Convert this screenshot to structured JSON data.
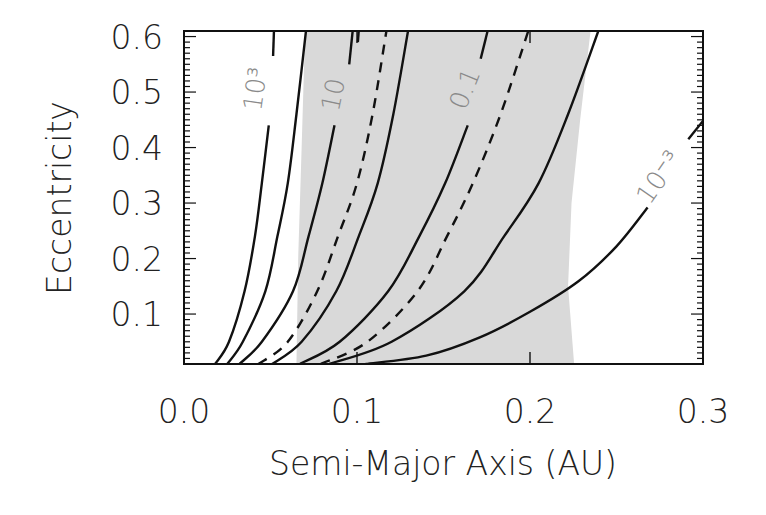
{
  "chart_data": {
    "type": "line",
    "title": "",
    "xlabel": "Semi-Major Axis (AU)",
    "ylabel": "Eccentricity",
    "xlim": [
      0.0,
      0.3
    ],
    "ylim": [
      0.01,
      0.61
    ],
    "grid": false,
    "legend": null,
    "x_ticks": [
      {
        "value": 0.0,
        "label": "0.0"
      },
      {
        "value": 0.1,
        "label": "0.1"
      },
      {
        "value": 0.2,
        "label": "0.2"
      },
      {
        "value": 0.3,
        "label": "0.3"
      }
    ],
    "y_ticks": [
      {
        "value": 0.1,
        "label": "0.1"
      },
      {
        "value": 0.2,
        "label": "0.2"
      },
      {
        "value": 0.3,
        "label": "0.3"
      },
      {
        "value": 0.4,
        "label": "0.4"
      },
      {
        "value": 0.5,
        "label": "0.5"
      },
      {
        "value": 0.6,
        "label": "0.6"
      }
    ],
    "shaded_region": {
      "color": "#d9d9d9",
      "left_edge": [
        [
          0.065,
          0.01
        ],
        [
          0.066,
          0.2
        ],
        [
          0.068,
          0.4
        ],
        [
          0.07,
          0.61
        ]
      ],
      "right_edge": [
        [
          0.235,
          0.61
        ],
        [
          0.229,
          0.45
        ],
        [
          0.224,
          0.3
        ],
        [
          0.222,
          0.15
        ],
        [
          0.2255,
          0.01
        ]
      ]
    },
    "series": [
      {
        "name": "10^3",
        "label": "10³",
        "style": "solid",
        "segments": [
          [
            [
              0.018,
              0.01
            ],
            [
              0.026,
              0.05
            ],
            [
              0.035,
              0.141
            ],
            [
              0.041,
              0.24
            ],
            [
              0.045,
              0.336
            ],
            [
              0.049,
              0.44
            ]
          ],
          [
            [
              0.0515,
              0.565
            ],
            [
              0.052,
              0.61
            ]
          ]
        ]
      },
      {
        "name": "c2",
        "label": "",
        "style": "solid",
        "segments": [
          [
            [
              0.025,
              0.01
            ],
            [
              0.034,
              0.05
            ],
            [
              0.047,
              0.141
            ],
            [
              0.054,
              0.24
            ],
            [
              0.06,
              0.336
            ],
            [
              0.065,
              0.46
            ],
            [
              0.0705,
              0.61
            ]
          ]
        ]
      },
      {
        "name": "10",
        "label": "10",
        "style": "solid",
        "segments": [
          [
            [
              0.032,
              0.01
            ],
            [
              0.045,
              0.05
            ],
            [
              0.063,
              0.141
            ],
            [
              0.072,
              0.24
            ],
            [
              0.08,
              0.336
            ],
            [
              0.087,
              0.44
            ]
          ],
          [
            [
              0.0955,
              0.55
            ],
            [
              0.0975,
              0.61
            ]
          ]
        ]
      },
      {
        "name": "c_short",
        "label": "",
        "style": "solid",
        "segments": [
          [
            [
              0.1005,
              0.59
            ],
            [
              0.101,
              0.61
            ]
          ]
        ]
      },
      {
        "name": "dashed1",
        "label": "",
        "style": "dashed",
        "segments": [
          [
            [
              0.043,
              0.01
            ],
            [
              0.06,
              0.05
            ],
            [
              0.077,
              0.141
            ],
            [
              0.089,
              0.24
            ],
            [
              0.1,
              0.336
            ],
            [
              0.109,
              0.46
            ],
            [
              0.117,
              0.61
            ]
          ]
        ]
      },
      {
        "name": "c4",
        "label": "",
        "style": "solid",
        "segments": [
          [
            [
              0.051,
              0.01
            ],
            [
              0.068,
              0.05
            ],
            [
              0.088,
              0.141
            ],
            [
              0.101,
              0.24
            ],
            [
              0.112,
              0.336
            ],
            [
              0.121,
              0.46
            ],
            [
              0.1295,
              0.61
            ]
          ]
        ]
      },
      {
        "name": "0.1",
        "label": "0.1",
        "style": "solid",
        "segments": [
          [
            [
              0.067,
              0.01
            ],
            [
              0.09,
              0.05
            ],
            [
              0.118,
              0.141
            ],
            [
              0.136,
              0.24
            ],
            [
              0.151,
              0.336
            ],
            [
              0.164,
              0.44
            ]
          ],
          [
            [
              0.1715,
              0.56
            ],
            [
              0.1755,
              0.61
            ]
          ]
        ]
      },
      {
        "name": "dashed2",
        "label": "",
        "style": "dashed",
        "segments": [
          [
            [
              0.079,
              0.01
            ],
            [
              0.106,
              0.05
            ],
            [
              0.135,
              0.141
            ],
            [
              0.152,
              0.24
            ],
            [
              0.167,
              0.336
            ],
            [
              0.183,
              0.46
            ],
            [
              0.199,
              0.61
            ]
          ]
        ]
      },
      {
        "name": "c8",
        "label": "",
        "style": "solid",
        "segments": [
          [
            [
              0.084,
              0.01
            ],
            [
              0.12,
              0.05
            ],
            [
              0.162,
              0.141
            ],
            [
              0.185,
              0.24
            ],
            [
              0.205,
              0.336
            ],
            [
              0.222,
              0.46
            ],
            [
              0.2395,
              0.61
            ]
          ]
        ]
      },
      {
        "name": "10^-3",
        "label": "10⁻³",
        "style": "solid",
        "segments": [
          [
            [
              0.105,
              0.01
            ],
            [
              0.14,
              0.025
            ],
            [
              0.171,
              0.058
            ],
            [
              0.2,
              0.104
            ],
            [
              0.228,
              0.159
            ],
            [
              0.25,
              0.222
            ],
            [
              0.268,
              0.292
            ]
          ],
          [
            [
              0.2915,
              0.415
            ],
            [
              0.3,
              0.448
            ]
          ]
        ]
      }
    ],
    "annotations": [
      {
        "text": "10³",
        "a": 0.042,
        "e": 0.505,
        "rotate": -82
      },
      {
        "text": "10",
        "a": 0.087,
        "e": 0.495,
        "rotate": -78
      },
      {
        "text": "0.1",
        "a": 0.163,
        "e": 0.505,
        "rotate": -68
      },
      {
        "text": "10⁻³",
        "a": 0.275,
        "e": 0.345,
        "rotate": -55
      }
    ]
  },
  "axes": {
    "xlabel": "Semi-Major Axis (AU)",
    "ylabel": "Eccentricity"
  }
}
